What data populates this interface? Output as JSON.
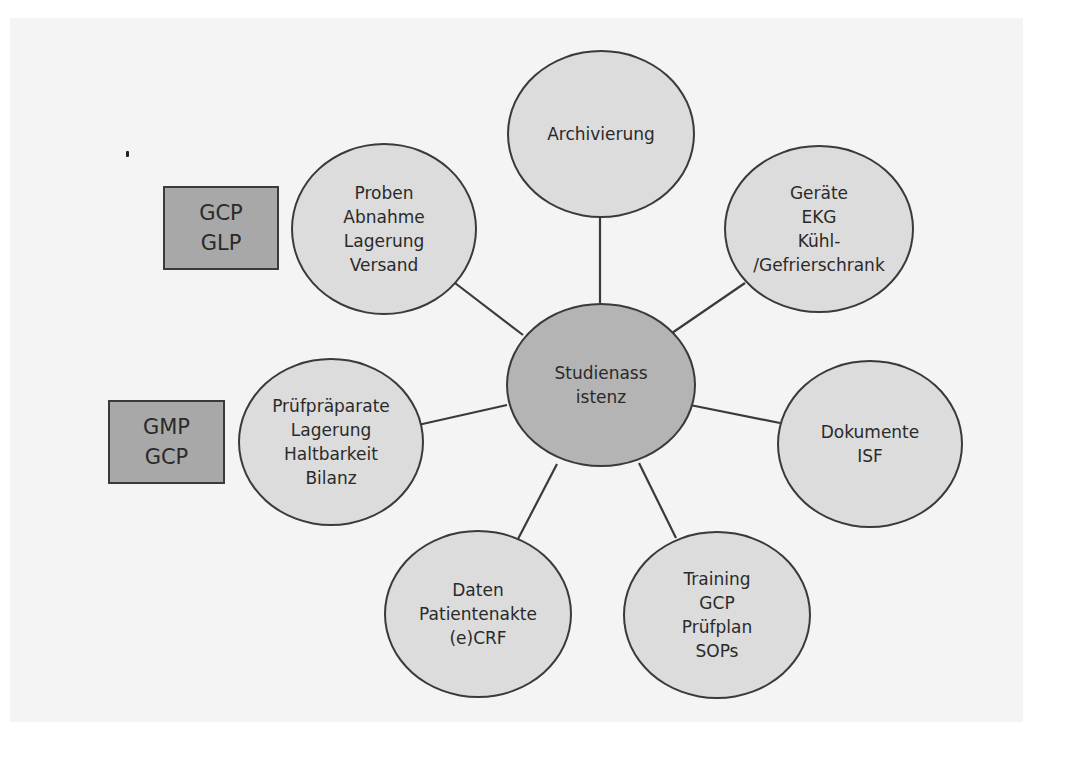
{
  "diagram": {
    "center": {
      "id": "studienassistenz",
      "lines": [
        "Studienass",
        "istenz"
      ]
    },
    "nodes": [
      {
        "id": "archivierung",
        "lines": [
          "Archivierung"
        ]
      },
      {
        "id": "geraete",
        "lines": [
          "Geräte",
          "EKG",
          "Kühl-",
          "/Gefrierschrank"
        ]
      },
      {
        "id": "dokumente",
        "lines": [
          "Dokumente",
          "ISF"
        ]
      },
      {
        "id": "training",
        "lines": [
          "Training",
          "GCP",
          "Prüfplan",
          "SOPs"
        ]
      },
      {
        "id": "daten",
        "lines": [
          "Daten",
          "Patientenakte",
          "(e)CRF"
        ]
      },
      {
        "id": "pruefpraeparate",
        "lines": [
          "Prüfpräparate",
          "Lagerung",
          "Haltbarkeit",
          "Bilanz"
        ]
      },
      {
        "id": "proben",
        "lines": [
          "Proben",
          "Abnahme",
          "Lagerung",
          "Versand"
        ]
      }
    ],
    "edges": [
      [
        "studienassistenz",
        "archivierung"
      ],
      [
        "studienassistenz",
        "geraete"
      ],
      [
        "studienassistenz",
        "dokumente"
      ],
      [
        "studienassistenz",
        "training"
      ],
      [
        "studienassistenz",
        "daten"
      ],
      [
        "studienassistenz",
        "pruefpraeparate"
      ],
      [
        "studienassistenz",
        "proben"
      ]
    ],
    "annotations": [
      {
        "id": "gcp-glp",
        "lines": [
          "GCP",
          "GLP"
        ],
        "attached_to": "proben"
      },
      {
        "id": "gmp-gcp",
        "lines": [
          "GMP",
          "GCP"
        ],
        "attached_to": "pruefpraeparate"
      }
    ],
    "colors": {
      "center_fill": "#b4b4b4",
      "node_fill": "#dcdcdc",
      "annotation_fill": "#a8a8a8",
      "stroke": "#3a3a3a"
    }
  }
}
